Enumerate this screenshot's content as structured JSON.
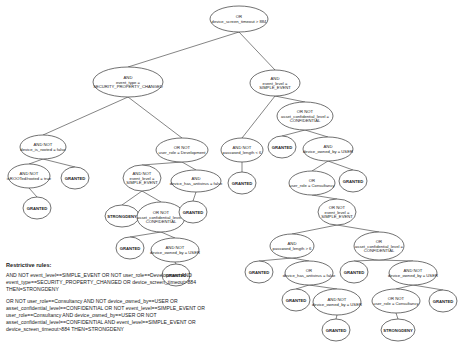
{
  "tree": {
    "nodes": [
      {
        "id": "n0",
        "x": 239,
        "y": 19,
        "rx": 29,
        "ry": 13,
        "lines": [
          "OR",
          "device_screen_timeout > 884"
        ]
      },
      {
        "id": "n1",
        "x": 128,
        "y": 82,
        "rx": 35,
        "ry": 15,
        "lines": [
          "AND",
          "event_type =",
          "SECURITY_PROPERTY_CHANGED"
        ]
      },
      {
        "id": "n2",
        "x": 275,
        "y": 83,
        "rx": 25,
        "ry": 13,
        "lines": [
          "AND",
          "event_level =",
          "SIMPLE_EVENT"
        ]
      },
      {
        "id": "n3",
        "x": 43,
        "y": 147,
        "rx": 23,
        "ry": 12,
        "lines": [
          "AND NOT",
          "device_is_rooted = false"
        ]
      },
      {
        "id": "n4",
        "x": 182,
        "y": 150,
        "rx": 26,
        "ry": 12,
        "lines": [
          "OR NOT",
          "user_role = Development"
        ]
      },
      {
        "id": "n5",
        "x": 242,
        "y": 150,
        "rx": 21,
        "ry": 12,
        "lines": [
          "AND NOT",
          "password_length < 6"
        ]
      },
      {
        "id": "n6",
        "x": 305,
        "y": 116,
        "rx": 28,
        "ry": 14,
        "lines": [
          "OR NOT",
          "asset_confidential_level =",
          "CONFIDENTIAL"
        ]
      },
      {
        "id": "n7",
        "x": 29,
        "y": 176,
        "rx": 21,
        "ry": 12,
        "lines": [
          "AND NOT",
          "isROOTed/rooted = true"
        ]
      },
      {
        "id": "n8",
        "x": 75,
        "y": 178,
        "rx": 14,
        "ry": 11,
        "lines": [
          "GRANTED"
        ],
        "leaf": true
      },
      {
        "id": "n9",
        "x": 142,
        "y": 178,
        "rx": 19,
        "ry": 13,
        "lines": [
          "AND NOT",
          "event_level =",
          "SIMPLE_EVENT"
        ]
      },
      {
        "id": "n10",
        "x": 196,
        "y": 181,
        "rx": 25,
        "ry": 11,
        "lines": [
          "AND",
          "device_has_antivirus = false"
        ]
      },
      {
        "id": "n11",
        "x": 242,
        "y": 183,
        "rx": 14,
        "ry": 11,
        "lines": [
          "GRANTED"
        ],
        "leaf": true
      },
      {
        "id": "n12",
        "x": 282,
        "y": 147,
        "rx": 14,
        "ry": 11,
        "lines": [
          "GRANTED"
        ],
        "leaf": true
      },
      {
        "id": "n13",
        "x": 328,
        "y": 149,
        "rx": 25,
        "ry": 12,
        "lines": [
          "AND",
          "device_owned_by = USER"
        ]
      },
      {
        "id": "n14",
        "x": 37,
        "y": 208,
        "rx": 14,
        "ry": 11,
        "lines": [
          "GRANTED"
        ],
        "leaf": true
      },
      {
        "id": "n15",
        "x": 122,
        "y": 216,
        "rx": 17,
        "ry": 11,
        "lines": [
          "STRONGDENY"
        ],
        "leaf": true
      },
      {
        "id": "n16",
        "x": 161,
        "y": 217,
        "rx": 24,
        "ry": 15,
        "lines": [
          "OR NOT",
          "asset_confidential_level =",
          "CONFIDENTIAL"
        ]
      },
      {
        "id": "n17",
        "x": 193,
        "y": 212,
        "rx": 14,
        "ry": 11,
        "lines": [
          "GRANTED"
        ],
        "leaf": true
      },
      {
        "id": "n18",
        "x": 312,
        "y": 183,
        "rx": 23,
        "ry": 12,
        "lines": [
          "OR",
          "user_role = Consultancy"
        ]
      },
      {
        "id": "n19",
        "x": 353,
        "y": 181,
        "rx": 14,
        "ry": 11,
        "lines": [
          "GRANTED"
        ],
        "leaf": true
      },
      {
        "id": "n20",
        "x": 130,
        "y": 248,
        "rx": 14,
        "ry": 11,
        "lines": [
          "GRANTED"
        ],
        "leaf": true
      },
      {
        "id": "n21",
        "x": 175,
        "y": 250,
        "rx": 24,
        "ry": 12,
        "lines": [
          "AND NOT",
          "device_owned_by = USER"
        ]
      },
      {
        "id": "n22",
        "x": 337,
        "y": 212,
        "rx": 19,
        "ry": 13,
        "lines": [
          "OR NOT",
          "event_level =",
          "SIMPLE_EVENT"
        ]
      },
      {
        "id": "n23",
        "x": 176,
        "y": 275,
        "rx": 14,
        "ry": 11,
        "lines": [
          "GRANTED"
        ],
        "leaf": true
      },
      {
        "id": "n24",
        "x": 292,
        "y": 246,
        "rx": 22,
        "ry": 12,
        "lines": [
          "AND",
          "password_length > 6"
        ]
      },
      {
        "id": "n25",
        "x": 379,
        "y": 246,
        "rx": 25,
        "ry": 14,
        "lines": [
          "OR",
          "asset_confidential_level =",
          "CONFIDENTIAL"
        ]
      },
      {
        "id": "n26",
        "x": 259,
        "y": 272,
        "rx": 14,
        "ry": 11,
        "lines": [
          "GRANTED"
        ],
        "leaf": true
      },
      {
        "id": "n27",
        "x": 309,
        "y": 273,
        "rx": 24,
        "ry": 12,
        "lines": [
          "OR",
          "device_has_antivirus = false"
        ]
      },
      {
        "id": "n28",
        "x": 354,
        "y": 272,
        "rx": 14,
        "ry": 11,
        "lines": [
          "GRANTED"
        ],
        "leaf": true
      },
      {
        "id": "n29",
        "x": 413,
        "y": 273,
        "rx": 24,
        "ry": 12,
        "lines": [
          "AND NOT",
          "device_owned_by = USER"
        ]
      },
      {
        "id": "n30",
        "x": 296,
        "y": 300,
        "rx": 14,
        "ry": 11,
        "lines": [
          "GRANTED"
        ],
        "leaf": true
      },
      {
        "id": "n31",
        "x": 337,
        "y": 302,
        "rx": 24,
        "ry": 13,
        "lines": [
          "AND NOT",
          "device_owned_by = USER"
        ]
      },
      {
        "id": "n32",
        "x": 396,
        "y": 301,
        "rx": 24,
        "ry": 12,
        "lines": [
          "OR NOT",
          "user_role = Consultancy"
        ]
      },
      {
        "id": "n33",
        "x": 443,
        "y": 301,
        "rx": 14,
        "ry": 11,
        "lines": [
          "GRANTED"
        ],
        "leaf": true
      },
      {
        "id": "n34",
        "x": 336,
        "y": 330,
        "rx": 14,
        "ry": 11,
        "lines": [
          "GRANTED"
        ],
        "leaf": true
      },
      {
        "id": "n35",
        "x": 398,
        "y": 330,
        "rx": 17,
        "ry": 11,
        "lines": [
          "STRONGDENY"
        ],
        "leaf": true
      }
    ],
    "edges": [
      [
        "n0",
        "n1"
      ],
      [
        "n0",
        "n2"
      ],
      [
        "n1",
        "n3"
      ],
      [
        "n1",
        "n4"
      ],
      [
        "n2",
        "n5"
      ],
      [
        "n2",
        "n6"
      ],
      [
        "n3",
        "n7"
      ],
      [
        "n3",
        "n8"
      ],
      [
        "n4",
        "n9"
      ],
      [
        "n4",
        "n10"
      ],
      [
        "n5",
        "n11"
      ],
      [
        "n6",
        "n12"
      ],
      [
        "n6",
        "n13"
      ],
      [
        "n7",
        "n14"
      ],
      [
        "n9",
        "n15"
      ],
      [
        "n9",
        "n16"
      ],
      [
        "n10",
        "n17"
      ],
      [
        "n13",
        "n18"
      ],
      [
        "n13",
        "n19"
      ],
      [
        "n16",
        "n20"
      ],
      [
        "n16",
        "n21"
      ],
      [
        "n18",
        "n22"
      ],
      [
        "n21",
        "n23"
      ],
      [
        "n22",
        "n24"
      ],
      [
        "n22",
        "n25"
      ],
      [
        "n24",
        "n26"
      ],
      [
        "n24",
        "n27"
      ],
      [
        "n25",
        "n28"
      ],
      [
        "n25",
        "n29"
      ],
      [
        "n27",
        "n30"
      ],
      [
        "n27",
        "n31"
      ],
      [
        "n29",
        "n32"
      ],
      [
        "n29",
        "n33"
      ],
      [
        "n31",
        "n34"
      ],
      [
        "n32",
        "n35"
      ]
    ]
  },
  "rules": {
    "title": "Restrictive rules:",
    "items": [
      "AND NOT event_level==SIMPLE_EVENT OR NOT user_role==Development AND event_type==SECURITY_PROPERTY_CHANGED OR device_screen_timeout>884 THEN=STRONGDENY",
      "OR NOT user_role==Consultancy AND NOT device_owned_by==USER OR asset_confidential_level==CONFIDENTIAL OR NOT event_level==SIMPLE_EVENT OR user_role==Consultancy AND device_owned_by==USER OR NOT asset_confidential_level==CONFIDENTIAL AND event_level==SIMPLE_EVENT OR device_screen_timeout>884 THEN=STRONGDENY"
    ]
  }
}
